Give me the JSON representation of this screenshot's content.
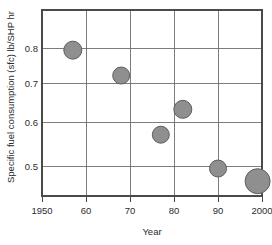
{
  "chart_data": {
    "type": "scatter",
    "title": "",
    "xlabel": "Year",
    "ylabel": "Specific fuel consumption (sfc)  lb/SHP hr",
    "xlim": [
      1950,
      2000
    ],
    "ylim": [
      0.435,
      0.875
    ],
    "grid": true,
    "legend": "none",
    "xticks": [
      1950,
      1960,
      1970,
      1980,
      1990,
      2000
    ],
    "xtick_labels": [
      "1950",
      "60",
      "70",
      "80",
      "90",
      "2000"
    ],
    "yticks": [
      0.5,
      0.6,
      0.7,
      0.8
    ],
    "ytick_labels": [
      "0.5",
      "0.6",
      "0.7",
      "0.8"
    ],
    "marker_color": "#8f8f8f",
    "marker_edge_color": "#5d5d5d",
    "points": [
      {
        "x": 1957,
        "y": 0.78,
        "r": 9.0
      },
      {
        "x": 1968,
        "y": 0.72,
        "r": 8.5
      },
      {
        "x": 1977,
        "y": 0.58,
        "r": 8.5
      },
      {
        "x": 1982,
        "y": 0.64,
        "r": 9.0
      },
      {
        "x": 1990,
        "y": 0.5,
        "r": 8.5
      },
      {
        "x": 1999,
        "y": 0.47,
        "r": 12.5
      }
    ]
  },
  "axes": {
    "x_axis_label": "Year",
    "y_axis_label": "Specific fuel consumption (sfc)  lb/SHP hr",
    "x_tick_labels": [
      "1950",
      "60",
      "70",
      "80",
      "90",
      "2000"
    ],
    "y_tick_labels": [
      "0.8",
      "0.7",
      "0.6",
      "0.5"
    ]
  }
}
